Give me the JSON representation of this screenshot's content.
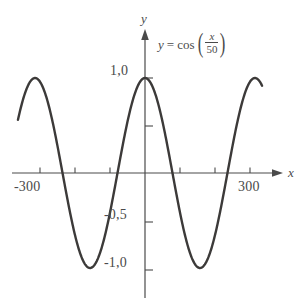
{
  "chart_data": {
    "type": "line",
    "title": "",
    "equation_display": {
      "lhs": "y",
      "equals": "=",
      "function": "cos",
      "numerator": "x",
      "denominator": "50",
      "open_paren": "(",
      "close_paren": ")",
      "plain": "y = cos(x/50)"
    },
    "xlabel": "x",
    "ylabel": "y",
    "xlim": [
      -363,
      335
    ],
    "ylim": [
      -1.35,
      1.45
    ],
    "grid": false,
    "legend": "none",
    "x_tick_labels": [
      "-300",
      "300"
    ],
    "y_tick_labels": [
      "1,0",
      "-0,5",
      "-1,0"
    ],
    "x_ticks_values": [
      -300,
      -200,
      -100,
      100,
      200,
      300
    ],
    "y_ticks_values": [
      1.0,
      0.5,
      -0.5,
      -1.0
    ],
    "series": [
      {
        "name": "y = cos(x/50)",
        "amplitude": 1.0,
        "period": 314.159,
        "color": "#3c3a39",
        "x_start": -363,
        "x_end": 335
      }
    ],
    "annotations": [
      {
        "text": "y = cos(x/50)",
        "x": 60,
        "y": 1.3
      }
    ]
  },
  "axes": {
    "x_axis_label": "x",
    "y_axis_label": "y",
    "x_labels": [
      {
        "text": "-300",
        "value": -300
      },
      {
        "text": "300",
        "value": 300
      }
    ],
    "y_labels": [
      {
        "text": "1,0",
        "value": 1.0
      },
      {
        "text": "-0,5",
        "value": -0.5
      },
      {
        "text": "-1,0",
        "value": -1.0
      }
    ]
  },
  "style": {
    "curve_color": "#3c3a39",
    "axis_color": "#4a4a4a",
    "text_color": "#4a4a4a",
    "background": "#ffffff"
  }
}
